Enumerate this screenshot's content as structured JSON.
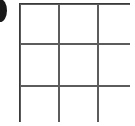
{
  "figure": {
    "type": "grid-diagram",
    "rows": 3,
    "columns": 3,
    "cell_count": 9,
    "line_color": "#5c5c5c",
    "cell_fill": "#ffffff",
    "background": "#ffffff",
    "line_width_px": 2,
    "bounds": {
      "left": 19,
      "top": 3,
      "width": 111,
      "height": 119
    },
    "cells": [
      {
        "row": 1,
        "col": 1,
        "label": ""
      },
      {
        "row": 1,
        "col": 2,
        "label": ""
      },
      {
        "row": 1,
        "col": 3,
        "label": ""
      },
      {
        "row": 2,
        "col": 1,
        "label": ""
      },
      {
        "row": 2,
        "col": 2,
        "label": ""
      },
      {
        "row": 2,
        "col": 3,
        "label": ""
      },
      {
        "row": 3,
        "col": 1,
        "label": ""
      },
      {
        "row": 3,
        "col": 2,
        "label": ""
      },
      {
        "row": 3,
        "col": 3,
        "label": ""
      }
    ]
  },
  "marker": {
    "name": "bullet-marker",
    "shape": "ellipse",
    "color": "#1a1a1a",
    "clipped": true,
    "edge": "left"
  }
}
